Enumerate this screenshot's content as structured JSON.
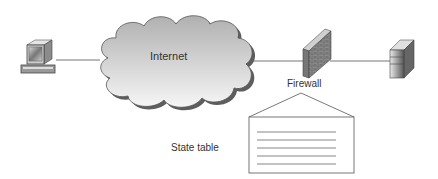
{
  "diagram": {
    "nodes": [
      {
        "id": "client",
        "kind": "workstation-icon"
      },
      {
        "id": "internet",
        "label": "Internet",
        "kind": "cloud"
      },
      {
        "id": "firewall",
        "label": "Firewall",
        "kind": "brick-wall-icon"
      },
      {
        "id": "server",
        "kind": "server-tower-icon"
      },
      {
        "id": "state_table",
        "label": "State table",
        "kind": "document"
      }
    ],
    "edges": [
      {
        "from": "client",
        "to": "internet"
      },
      {
        "from": "internet",
        "to": "firewall"
      },
      {
        "from": "firewall",
        "to": "server"
      },
      {
        "from": "firewall",
        "to": "state_table",
        "style": "callout"
      }
    ],
    "labels": {
      "internet": "Internet",
      "firewall": "Firewall",
      "state_table": "State table"
    },
    "colors": {
      "line": "#6e6e6e",
      "cloud_fill_top": "#b8b8b8",
      "cloud_fill_bottom": "#f4f4f4",
      "cloud_outline": "#555555"
    }
  }
}
